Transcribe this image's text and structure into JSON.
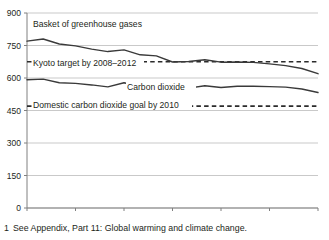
{
  "footnote": {
    "marker": "1",
    "text": "See Appendix, Part 11: Global warming and climate change."
  },
  "axis": {
    "y_ticks": [
      "900",
      "750",
      "600",
      "450",
      "300",
      "150",
      "0"
    ],
    "x_ticks": [
      "1990",
      "1993",
      "1996",
      "1999",
      "2002",
      "2005",
      "2008"
    ]
  },
  "labels": {
    "greenhouse": "Basket of greenhouse gases",
    "kyoto": "Kyoto target by 2008–2012",
    "carbon": "Carbon dioxide",
    "domestic": "Domestic carbon dioxide goal by 2010"
  },
  "colors": {
    "line": "#3a3a3a",
    "gridline": "#c9c9c9",
    "axis": "#808080",
    "text": "#231f20",
    "background": "#ffffff"
  },
  "chart_data": {
    "type": "line",
    "title": "",
    "xlabel": "",
    "ylabel": "",
    "xlim": [
      1990,
      2008
    ],
    "ylim": [
      0,
      900
    ],
    "ytick_values": [
      0,
      150,
      300,
      450,
      600,
      750,
      900
    ],
    "xtick_values": [
      1990,
      1993,
      1996,
      1999,
      2002,
      2005,
      2008
    ],
    "grid": "horizontal",
    "legend": "inline-annotations",
    "x": [
      1990,
      1991,
      1992,
      1993,
      1994,
      1995,
      1996,
      1997,
      1998,
      1999,
      2000,
      2001,
      2002,
      2003,
      2004,
      2005,
      2006,
      2007,
      2008
    ],
    "series": [
      {
        "name": "Basket of greenhouse gases",
        "style": "solid",
        "values": [
          770,
          780,
          757,
          748,
          733,
          722,
          730,
          707,
          702,
          674,
          676,
          684,
          673,
          674,
          672,
          665,
          657,
          644,
          620
        ]
      },
      {
        "name": "Carbon dioxide",
        "style": "solid",
        "values": [
          592,
          595,
          578,
          575,
          568,
          559,
          578,
          561,
          560,
          549,
          553,
          564,
          556,
          562,
          562,
          560,
          558,
          549,
          533
        ]
      }
    ],
    "reference_lines": [
      {
        "name": "Kyoto target by 2008–2012",
        "value": 675,
        "style": "dashed"
      },
      {
        "name": "Domestic carbon dioxide goal by 2010",
        "value": 470,
        "style": "dashed"
      }
    ]
  }
}
